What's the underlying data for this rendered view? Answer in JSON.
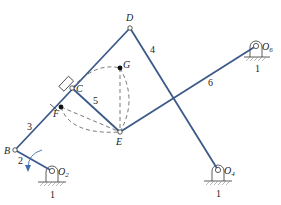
{
  "diagram": {
    "type": "planar-linkage-mechanism",
    "points": {
      "D": {
        "label": "D",
        "x": 130,
        "y": 28
      },
      "C": {
        "label": "C",
        "x": 72,
        "y": 88
      },
      "G": {
        "label": "G",
        "x": 120,
        "y": 68
      },
      "F": {
        "label": "F",
        "x": 61,
        "y": 107
      },
      "E": {
        "label": "E",
        "x": 120,
        "y": 132
      },
      "B": {
        "label": "B",
        "x": 15,
        "y": 150
      },
      "O2": {
        "label": "O",
        "sub": "2",
        "x": 52,
        "y": 171
      },
      "O4": {
        "label": "O",
        "sub": "4",
        "x": 218,
        "y": 170
      },
      "O6": {
        "label": "O",
        "sub": "6",
        "x": 256,
        "y": 46
      }
    },
    "link_numbers": {
      "ground_a": "1",
      "ground_b": "1",
      "ground_c": "1",
      "link2": "2",
      "link3": "3",
      "link4": "4",
      "link5": "5",
      "link6": "6"
    },
    "colors": {
      "link": "#3d5a8a",
      "rotation_arrow": "#3d6fb0"
    }
  }
}
